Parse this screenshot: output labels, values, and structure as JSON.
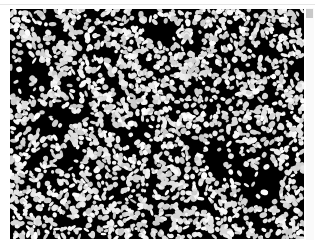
{
  "image": {
    "description": "Grayscale micrograph: dense field of bright white irregular cell-like particles on a black background",
    "colors": {
      "background": "#000000",
      "particles": "#ffffff",
      "frame": "#ffffff",
      "top_rule": "#e6e6e6",
      "scroll_thumb": "#c8c8c8"
    }
  },
  "scrollbar": {
    "icon": "scroll-thumb"
  }
}
